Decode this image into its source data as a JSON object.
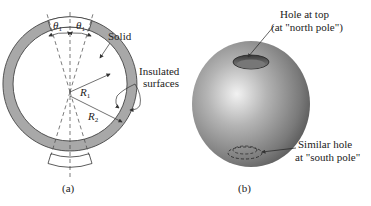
{
  "figure_a": {
    "caption": "(a)",
    "labels": {
      "theta_left": "θ",
      "theta_right": "θ",
      "theta_sub": "1",
      "solid": "Solid",
      "insulated_line1": "Insulated",
      "insulated_line2": "surfaces",
      "r1": "R",
      "r1_sub": "1",
      "r2": "R",
      "r2_sub": "2"
    }
  },
  "figure_b": {
    "caption": "(b)",
    "labels": {
      "top_hole_line1": "Hole at top",
      "top_hole_line2": "(at \"north pole\")",
      "bottom_hole_line1": "Similar hole",
      "bottom_hole_line2": "at \"south pole\""
    }
  },
  "colors": {
    "solid_fill": "#a8a8a8",
    "line": "#333333",
    "sphere_light": "#e6e6e6",
    "sphere_dark": "#4a4a4a"
  }
}
